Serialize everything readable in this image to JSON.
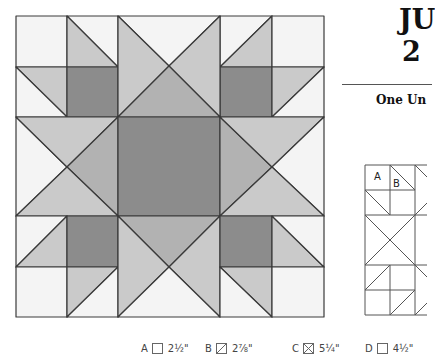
{
  "heading": {
    "line1": "JU",
    "line2": "2",
    "subtitle": "One Un"
  },
  "colors": {
    "white": "#f4f4f4",
    "light": "#cacaca",
    "medium": "#b2b2b2",
    "dark": "#8c8c8c",
    "line": "#3a3a3a"
  },
  "diagram": {
    "labels": [
      "A",
      "B"
    ]
  },
  "legend": [
    {
      "letter": "A",
      "shape": "square",
      "size": "2½\""
    },
    {
      "letter": "B",
      "shape": "half-square-triangle",
      "size": "2⅞\""
    },
    {
      "letter": "C",
      "shape": "quarter-square-triangle",
      "size": "5¼\""
    },
    {
      "letter": "D",
      "shape": "square",
      "size": "4½\""
    }
  ]
}
